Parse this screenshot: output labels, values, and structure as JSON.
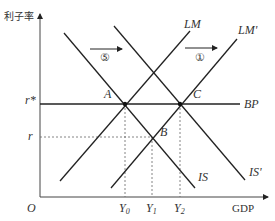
{
  "diagram": {
    "type": "IS-LM-BP",
    "y_axis_label": "利子率",
    "x_axis_label": "GDP",
    "origin_label": "O",
    "rate_labels": {
      "r_star": "r*",
      "r": "r"
    },
    "output_labels": [
      {
        "base": "Y",
        "sub": "0"
      },
      {
        "base": "Y",
        "sub": "1"
      },
      {
        "base": "Y",
        "sub": "2"
      }
    ],
    "curves": {
      "LM": "LM",
      "LM_prime": "LM'",
      "IS": "IS",
      "IS_prime": "IS'",
      "BP": "BP"
    },
    "points": {
      "A": "A",
      "B": "B",
      "C": "C"
    },
    "shifts": [
      {
        "label": "⑤",
        "direction": "right",
        "applies_to": "IS"
      },
      {
        "label": "①",
        "direction": "right",
        "applies_to": "LM"
      }
    ],
    "colors": {
      "line": "#222222",
      "dashed": "#666666",
      "text": "#333333"
    }
  }
}
